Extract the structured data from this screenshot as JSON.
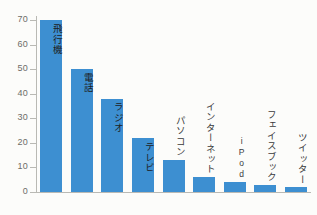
{
  "chart_data": {
    "type": "bar",
    "title": "",
    "xlabel": "",
    "ylabel": "",
    "ylim": [
      0,
      75
    ],
    "grid": false,
    "legend": null,
    "axis_color": "#b9b9b4",
    "bar_color": "#3d8fd1",
    "background": "#fcfcfa",
    "yticks": [
      0,
      10,
      20,
      30,
      40,
      50,
      60,
      70
    ],
    "ytick_labels": [
      "0",
      "10",
      "20",
      "30",
      "40",
      "50",
      "60",
      "70"
    ],
    "categories": [
      "飛行機",
      "電話",
      "ラジオ",
      "テレビ",
      "パソコン",
      "インターネット",
      "iPod",
      "フェイスブック",
      "ツイッター"
    ],
    "values": [
      70,
      50,
      38,
      22,
      13,
      6,
      4,
      3,
      2
    ],
    "label_placement": [
      "inside",
      "inside",
      "inside",
      "inside",
      "outside",
      "outside",
      "outside",
      "outside",
      "outside"
    ]
  },
  "bars": [
    {
      "label": "飛行機",
      "value": 70,
      "placement": "inside",
      "latin": false
    },
    {
      "label": "電話",
      "value": 50,
      "placement": "inside",
      "latin": false
    },
    {
      "label": "ラジオ",
      "value": 38,
      "placement": "inside",
      "latin": false
    },
    {
      "label": "テレビ",
      "value": 22,
      "placement": "inside",
      "latin": false
    },
    {
      "label": "パソコン",
      "value": 13,
      "placement": "outside",
      "latin": false
    },
    {
      "label": "インターネット",
      "value": 6,
      "placement": "outside",
      "latin": false
    },
    {
      "label": "iPod",
      "value": 4,
      "placement": "outside",
      "latin": true
    },
    {
      "label": "フェイスブック",
      "value": 3,
      "placement": "outside",
      "latin": false
    },
    {
      "label": "ツイッター",
      "value": 2,
      "placement": "outside",
      "latin": false
    }
  ]
}
